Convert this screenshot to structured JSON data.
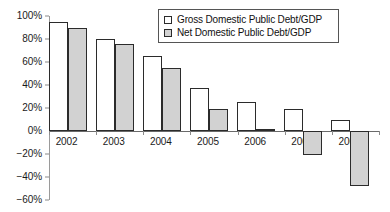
{
  "chart_data": {
    "type": "bar",
    "title": "",
    "xlabel": "",
    "ylabel": "",
    "categories": [
      "2002",
      "2003",
      "2004",
      "2005",
      "2006",
      "2007",
      "2008"
    ],
    "series": [
      {
        "name": "Gross Domestic Public Debt/GDP",
        "fill": "#ffffff",
        "values": [
          95,
          80,
          65,
          37,
          25,
          19,
          10
        ]
      },
      {
        "name": "Net Domestic Public Debt/GDP",
        "fill": "#d2d2d2",
        "values": [
          90,
          75.5,
          55,
          19.5,
          2,
          -21,
          -48
        ]
      }
    ],
    "ylim": [
      -60,
      100
    ],
    "ytick_values": [
      100,
      80,
      60,
      40,
      20,
      0,
      -20,
      -40,
      -60
    ],
    "ytick_labels": [
      "100%",
      "80%",
      "60%",
      "40%",
      "20%",
      "0%",
      "−20%",
      "−40%",
      "−60%"
    ],
    "unit": "%",
    "grid": false,
    "legend_position": "upper-right-inside"
  },
  "legend": {
    "entries": [
      {
        "label": "Gross Domestic Public Debt/GDP",
        "swatch": "gross"
      },
      {
        "label": "Net Domestic Public Debt/GDP",
        "swatch": "net"
      }
    ]
  },
  "colors": {
    "gross_fill": "#ffffff",
    "net_fill": "#d2d2d2",
    "bar_border": "#2b2b2b",
    "axis": "#6a6a6a",
    "text": "#1a1a1a",
    "background": "#ffffff"
  }
}
